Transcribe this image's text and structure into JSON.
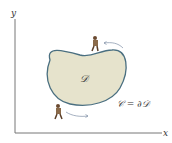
{
  "axes": {
    "x_label": "x",
    "y_label": "y"
  },
  "region": {
    "label": "𝒟",
    "fill": "#e6e3cc",
    "stroke": "#4a6f80"
  },
  "boundary": {
    "label": "𝒞 = ∂𝒟"
  },
  "arrows": {
    "color": "#7f8fa6"
  },
  "walkers": [
    {
      "position": "top"
    },
    {
      "position": "bottom-left"
    }
  ]
}
